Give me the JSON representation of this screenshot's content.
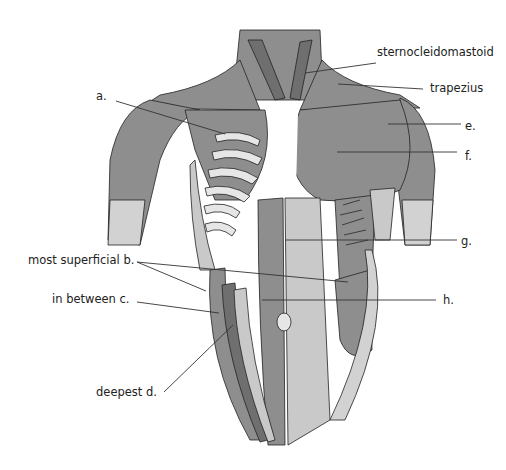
{
  "diagram": {
    "type": "anatomical illustration",
    "colors": {
      "muscle": "#8e8e8e",
      "muscle_dark": "#6f6f6f",
      "tendon": "#e6e6e6",
      "outline": "#222222",
      "label": "#222222"
    },
    "labels": {
      "sternocleidomastoid": "sternocleidomastoid",
      "trapezius": "trapezius",
      "a": "a.",
      "e": "e.",
      "f": "f.",
      "g": "g.",
      "h": "h.",
      "b": "most superficial b.",
      "c": "in between  c.",
      "d": "deepest  d."
    }
  }
}
